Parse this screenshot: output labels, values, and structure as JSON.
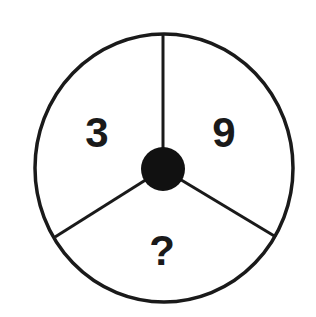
{
  "puzzle": {
    "type": "number-wheel",
    "segments": [
      {
        "position": "top-left",
        "value": "3"
      },
      {
        "position": "top-right",
        "value": "9"
      },
      {
        "position": "bottom",
        "value": "?"
      }
    ],
    "colors": {
      "stroke": "#1a1a1a",
      "background": "#ffffff",
      "hub": "#111111"
    }
  }
}
